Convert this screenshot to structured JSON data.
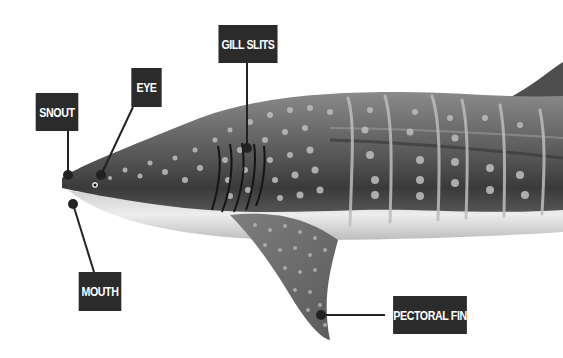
{
  "diagram": {
    "labels": [
      {
        "id": "snout",
        "text": "SNOUT"
      },
      {
        "id": "eye",
        "text": "EYE"
      },
      {
        "id": "gill-slits",
        "text": "GILL SLITS"
      },
      {
        "id": "mouth",
        "text": "MOUTH"
      },
      {
        "id": "pectoral-fin",
        "text": "PECTORAL FIN"
      }
    ],
    "colors": {
      "label_bg": "#2b2b2b",
      "label_text": "#ffffff",
      "body_dark": "#4a4a4a",
      "body_mid": "#7a7a7a",
      "belly": "#e8e8e8",
      "spots": "#b8b8b8",
      "leader_line": "#222222"
    }
  }
}
